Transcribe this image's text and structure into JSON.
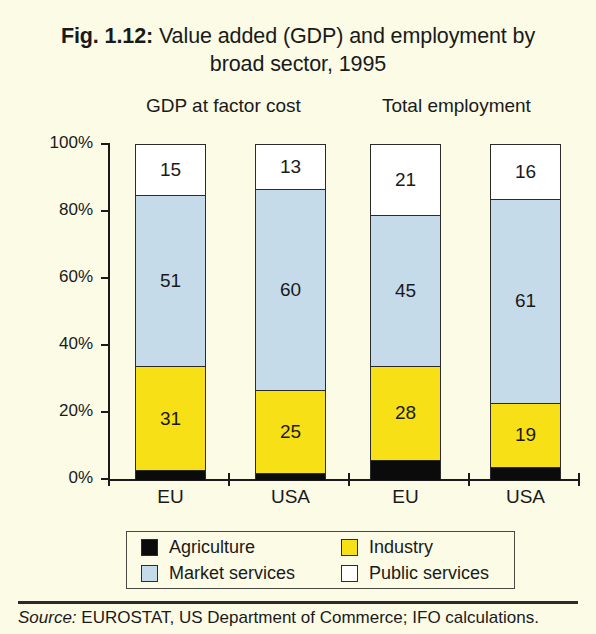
{
  "title": {
    "figure_number": "Fig. 1.12:",
    "text": " Value added (GDP) and employment by broad sector, 1995"
  },
  "panels": [
    {
      "name": "gdp",
      "header": "GDP at factor cost"
    },
    {
      "name": "employment",
      "header": "Total employment"
    }
  ],
  "source": {
    "label": "Source:",
    "text": " EUROSTAT, US Department of Commerce; IFO calculations."
  },
  "chart_data": {
    "type": "bar",
    "subtype": "stacked-percentage",
    "title": "Fig. 1.12: Value added (GDP) and employment by broad sector, 1995",
    "panel_titles": [
      "GDP at factor cost",
      "Total employment"
    ],
    "xlabel": "",
    "ylabel": "",
    "ylim": [
      0,
      100
    ],
    "ytick_labels": [
      "0%",
      "20%",
      "40%",
      "60%",
      "80%",
      "100%"
    ],
    "ytick_values": [
      0,
      20,
      40,
      60,
      80,
      100
    ],
    "grid": false,
    "legend_position": "bottom",
    "categories": [
      "EU",
      "USA",
      "EU",
      "USA"
    ],
    "series": [
      {
        "name": "Agriculture",
        "color": "#0b0b0b",
        "values": [
          3,
          2,
          6,
          4
        ]
      },
      {
        "name": "Industry",
        "color": "#f7e016",
        "values": [
          31,
          25,
          28,
          19
        ]
      },
      {
        "name": "Market services",
        "color": "#c6dbea",
        "values": [
          51,
          60,
          45,
          61
        ]
      },
      {
        "name": "Public services",
        "color": "#ffffff",
        "values": [
          15,
          13,
          21,
          16
        ]
      }
    ],
    "bars": [
      {
        "label": "EU",
        "panel": "GDP at factor cost",
        "segments": [
          {
            "series": "Public services",
            "value": 15,
            "data_label": "15"
          },
          {
            "series": "Market services",
            "value": 51,
            "data_label": "51"
          },
          {
            "series": "Industry",
            "value": 31,
            "data_label": "31"
          },
          {
            "series": "Agriculture",
            "value": 3,
            "data_label": ""
          }
        ]
      },
      {
        "label": "USA",
        "panel": "GDP at factor cost",
        "segments": [
          {
            "series": "Public services",
            "value": 13,
            "data_label": "13"
          },
          {
            "series": "Market services",
            "value": 60,
            "data_label": "60"
          },
          {
            "series": "Industry",
            "value": 25,
            "data_label": "25"
          },
          {
            "series": "Agriculture",
            "value": 2,
            "data_label": ""
          }
        ]
      },
      {
        "label": "EU",
        "panel": "Total employment",
        "segments": [
          {
            "series": "Public services",
            "value": 21,
            "data_label": "21"
          },
          {
            "series": "Market services",
            "value": 45,
            "data_label": "45"
          },
          {
            "series": "Industry",
            "value": 28,
            "data_label": "28"
          },
          {
            "series": "Agriculture",
            "value": 6,
            "data_label": ""
          }
        ]
      },
      {
        "label": "USA",
        "panel": "Total employment",
        "segments": [
          {
            "series": "Public services",
            "value": 16,
            "data_label": "16"
          },
          {
            "series": "Market services",
            "value": 61,
            "data_label": "61"
          },
          {
            "series": "Industry",
            "value": 19,
            "data_label": "19"
          },
          {
            "series": "Agriculture",
            "value": 4,
            "data_label": ""
          }
        ]
      }
    ],
    "legend": [
      {
        "label": "Agriculture",
        "color": "#0b0b0b"
      },
      {
        "label": "Industry",
        "color": "#f7e016"
      },
      {
        "label": "Market services",
        "color": "#c6dbea"
      },
      {
        "label": "Public services",
        "color": "#ffffff"
      }
    ]
  }
}
